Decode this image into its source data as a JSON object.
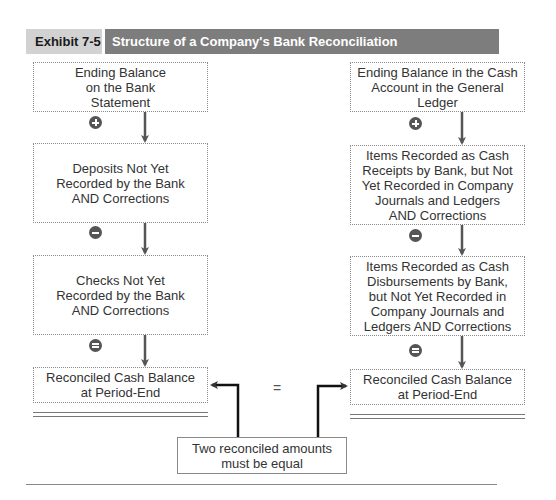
{
  "header": {
    "exhibit_label": "Exhibit 7-5",
    "title": "Structure of a Company's Bank Reconciliation"
  },
  "left_column": {
    "boxes": [
      {
        "label": "Ending Balance\non the Bank\nStatement"
      },
      {
        "label": "Deposits Not Yet\nRecorded by the Bank\nAND Corrections"
      },
      {
        "label": "Checks Not Yet\nRecorded by the Bank\nAND Corrections"
      },
      {
        "label": "Reconciled Cash Balance\nat Period-End"
      }
    ],
    "operators": [
      "plus",
      "minus",
      "equals"
    ]
  },
  "right_column": {
    "boxes": [
      {
        "label": "Ending Balance in the Cash\nAccount in the General\nLedger"
      },
      {
        "label": "Items Recorded as Cash\nReceipts by Bank, but Not\nYet Recorded in Company\nJournals and Ledgers\nAND Corrections"
      },
      {
        "label": "Items Recorded as Cash\nDisbursements by Bank,\nbut Not Yet Recorded in\nCompany Journals and\nLedgers AND Corrections"
      },
      {
        "label": "Reconciled Cash Balance\nat Period-End"
      }
    ],
    "operators": [
      "plus",
      "minus",
      "equals"
    ]
  },
  "equals_sign": "=",
  "note": "Two reconciled amounts must be equal",
  "colors": {
    "exhibit_tag_bg": "#d2d2d2",
    "title_bg": "#7d7d7d",
    "operator_fill": "#555555",
    "arrow": "#555555"
  }
}
